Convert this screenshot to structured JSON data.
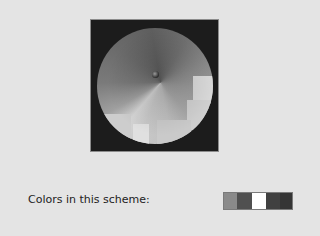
{
  "preview": {
    "frame_color": "#1c1c1c"
  },
  "scheme": {
    "caption": "Colors in this scheme:",
    "swatches": [
      {
        "color": "#8a8a8a",
        "width": 13
      },
      {
        "color": "#505050",
        "width": 15
      },
      {
        "color": "#ffffff",
        "width": 14
      },
      {
        "color": "#404040",
        "width": 14
      },
      {
        "color": "#353535",
        "width": 12
      }
    ]
  }
}
